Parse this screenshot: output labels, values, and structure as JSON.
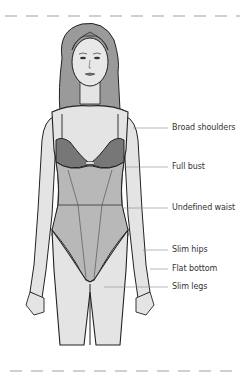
{
  "illustration": {
    "subject": "female body shape figure in bodysuit",
    "colors": {
      "skin": "#e4e4e4",
      "hair": "#9a9a9a",
      "bra": "#777777",
      "bodysuit": "#b5b5b5",
      "outline": "#222222",
      "dash": "#cfcfcf"
    }
  },
  "annotations": [
    {
      "label": "Broad shoulders",
      "y": 128
    },
    {
      "label": "Full bust",
      "y": 167
    },
    {
      "label": "Undefined waist",
      "y": 208
    },
    {
      "label": "Slim hips",
      "y": 250
    },
    {
      "label": "Flat bottom",
      "y": 269
    },
    {
      "label": "Slim legs",
      "y": 287
    }
  ]
}
